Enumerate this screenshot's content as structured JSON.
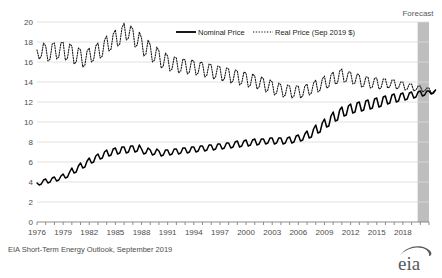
{
  "chart_data": {
    "type": "line",
    "title": "",
    "xlabel": "",
    "ylabel": "",
    "ylim": [
      0,
      20
    ],
    "xlim": [
      1976,
      2021
    ],
    "grid": true,
    "legend_position": "top-center",
    "yticks": [
      "0",
      "2",
      "4",
      "6",
      "8",
      "10",
      "12",
      "14",
      "16",
      "18",
      "20"
    ],
    "xticks": [
      "1976",
      "1979",
      "1982",
      "1985",
      "1988",
      "1991",
      "1994",
      "1997",
      "2000",
      "2003",
      "2006",
      "2009",
      "2012",
      "2015",
      "2018"
    ],
    "annotations": [
      {
        "name": "forecast-label",
        "text": "Forecast",
        "x": 2019.6
      }
    ],
    "forecast_start": 2019.7,
    "forecast_end": 2021.0,
    "series": [
      {
        "name": "Nominal Price",
        "style": "solid",
        "color": "#000000",
        "x_start": 1976.0,
        "x_step": 0.25,
        "values": [
          3.9,
          3.7,
          3.8,
          4.2,
          4.3,
          3.9,
          4.0,
          4.4,
          4.5,
          4.1,
          4.2,
          4.6,
          4.8,
          4.4,
          4.5,
          5.0,
          5.4,
          4.9,
          5.0,
          5.6,
          5.9,
          5.4,
          5.5,
          6.1,
          6.4,
          5.9,
          6.0,
          6.6,
          6.8,
          6.3,
          6.4,
          7.0,
          7.2,
          6.6,
          6.7,
          7.3,
          7.4,
          6.8,
          6.9,
          7.5,
          7.5,
          6.9,
          7.0,
          7.6,
          7.6,
          7.0,
          7.1,
          7.7,
          7.3,
          6.8,
          6.9,
          7.4,
          7.2,
          6.7,
          6.8,
          7.3,
          7.1,
          6.6,
          6.7,
          7.2,
          7.2,
          6.7,
          6.8,
          7.3,
          7.3,
          6.8,
          6.9,
          7.4,
          7.4,
          6.9,
          7.0,
          7.5,
          7.5,
          7.0,
          7.1,
          7.6,
          7.6,
          7.1,
          7.2,
          7.7,
          7.7,
          7.2,
          7.3,
          7.8,
          7.8,
          7.3,
          7.4,
          7.9,
          7.9,
          7.4,
          7.5,
          8.0,
          8.1,
          7.5,
          7.6,
          8.1,
          8.2,
          7.6,
          7.7,
          8.2,
          8.3,
          7.7,
          7.8,
          8.3,
          8.3,
          7.8,
          7.9,
          8.4,
          8.4,
          7.8,
          7.9,
          8.4,
          8.4,
          7.8,
          7.9,
          8.4,
          8.5,
          7.9,
          8.0,
          8.6,
          8.7,
          8.1,
          8.2,
          8.8,
          9.1,
          8.4,
          8.5,
          9.3,
          9.7,
          8.9,
          9.0,
          9.9,
          10.3,
          9.5,
          9.6,
          10.6,
          11.0,
          10.1,
          10.2,
          11.2,
          11.5,
          10.6,
          10.7,
          11.6,
          11.8,
          10.9,
          11.0,
          11.9,
          12.0,
          11.1,
          11.2,
          12.1,
          12.2,
          11.3,
          11.4,
          12.3,
          12.4,
          11.5,
          11.6,
          12.5,
          12.6,
          11.8,
          11.9,
          12.7,
          12.8,
          12.0,
          12.1,
          12.8,
          12.9,
          12.2,
          12.3,
          12.9,
          13.0,
          12.4,
          12.5,
          13.0,
          13.1,
          12.6,
          12.7,
          13.1,
          13.1,
          12.8,
          12.9,
          13.2
        ]
      },
      {
        "name": "Real Price (Sep 2019 $)",
        "style": "dotted",
        "color": "#1a1a1a",
        "x_start": 1976.0,
        "x_step": 0.25,
        "values": [
          17.2,
          16.3,
          16.6,
          17.9,
          17.6,
          16.1,
          16.3,
          17.8,
          17.9,
          16.3,
          16.5,
          17.9,
          18.0,
          16.2,
          16.4,
          17.8,
          17.6,
          15.8,
          16.0,
          17.4,
          17.2,
          15.5,
          15.7,
          17.1,
          17.4,
          16.0,
          16.2,
          17.6,
          17.9,
          16.4,
          16.6,
          18.2,
          18.6,
          17.1,
          17.3,
          18.8,
          19.2,
          17.6,
          17.8,
          19.4,
          19.9,
          18.2,
          18.4,
          19.6,
          19.3,
          17.5,
          17.7,
          19.0,
          18.4,
          16.6,
          16.8,
          18.2,
          17.7,
          16.0,
          16.2,
          17.5,
          17.1,
          15.4,
          15.6,
          16.9,
          16.6,
          15.1,
          15.3,
          16.5,
          16.4,
          14.9,
          15.1,
          16.3,
          16.2,
          14.8,
          15.0,
          16.2,
          16.1,
          14.7,
          14.9,
          16.0,
          15.9,
          14.5,
          14.7,
          15.8,
          15.7,
          14.3,
          14.5,
          15.6,
          15.5,
          14.1,
          14.3,
          15.4,
          15.3,
          13.9,
          14.1,
          15.2,
          15.1,
          13.7,
          13.9,
          15.0,
          14.9,
          13.5,
          13.7,
          14.8,
          14.6,
          13.3,
          13.5,
          14.5,
          14.3,
          13.0,
          13.2,
          14.2,
          14.0,
          12.7,
          12.9,
          13.9,
          13.7,
          12.5,
          12.7,
          13.7,
          13.6,
          12.4,
          12.6,
          13.6,
          13.6,
          12.4,
          12.6,
          13.6,
          13.8,
          12.7,
          12.9,
          13.9,
          14.2,
          13.0,
          13.2,
          14.3,
          14.6,
          13.4,
          13.5,
          14.7,
          15.0,
          13.8,
          13.9,
          15.1,
          15.3,
          14.0,
          14.1,
          15.0,
          15.0,
          13.8,
          13.9,
          14.8,
          14.7,
          13.5,
          13.6,
          14.5,
          14.5,
          13.4,
          13.5,
          14.4,
          14.4,
          13.3,
          13.4,
          14.3,
          14.3,
          13.4,
          13.5,
          14.2,
          14.2,
          13.3,
          13.4,
          14.0,
          14.0,
          13.2,
          13.3,
          13.8,
          13.8,
          13.1,
          13.2,
          13.6,
          13.6,
          13.0,
          13.1,
          13.4,
          13.4,
          12.9,
          13.0,
          13.2
        ]
      }
    ]
  },
  "legend": {
    "items": [
      {
        "label": "Nominal Price",
        "style": "solid"
      },
      {
        "label": "Real Price (Sep 2019 $)",
        "style": "dotted"
      }
    ]
  },
  "footer": {
    "source": "EIA Short-Term Energy Outlook, September 2019",
    "logo": "eia"
  }
}
